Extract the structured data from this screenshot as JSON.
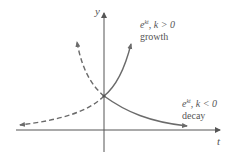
{
  "diagram": {
    "axes": {
      "x_label": "t",
      "y_label": "y"
    },
    "curves": [
      {
        "id": "growth",
        "formula_base": "e",
        "formula_exp": "kt",
        "condition": ", k > 0",
        "caption": "growth",
        "style": "solid"
      },
      {
        "id": "decay",
        "formula_base": "e",
        "formula_exp": "kt",
        "condition": ", k < 0",
        "caption": "decay",
        "style": "solid"
      }
    ],
    "colors": {
      "curve": "#6b6b6b",
      "axis": "#555555",
      "text": "#555555"
    }
  }
}
